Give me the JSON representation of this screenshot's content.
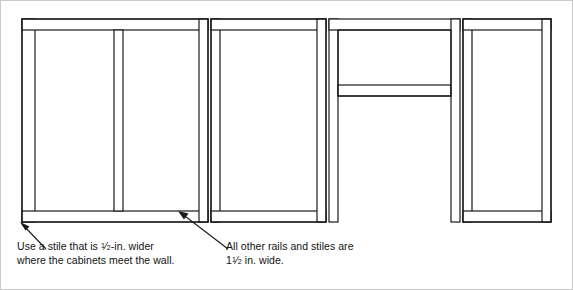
{
  "diagram": {
    "line_color": "#1a1a1a",
    "fill_color": "#ffffff",
    "border_color": "#c9c9c9",
    "background": "#ffffff",
    "stroke_width": 1.2,
    "sections": [
      {
        "name": "left-cabinet",
        "note": "wall-side cabinet with wider left stile and center divider"
      },
      {
        "name": "second-cabinet",
        "note": "standard cabinet opening"
      },
      {
        "name": "knee-space-section",
        "note": "short opening above open knee space, no bottom rail"
      },
      {
        "name": "right-cabinet",
        "note": "end cabinet opening"
      }
    ]
  },
  "callouts": {
    "wall_stile": {
      "line1_before": "Use a stile that is ",
      "line1_frac_num": "1",
      "line1_frac_den": "2",
      "line1_after": "-in. wider",
      "line2": "where the cabinets meet the wall."
    },
    "other_rails": {
      "line1": "All other rails and stiles are",
      "line2_whole": "1",
      "line2_frac_num": "1",
      "line2_frac_den": "2",
      "line2_after": " in. wide."
    }
  }
}
